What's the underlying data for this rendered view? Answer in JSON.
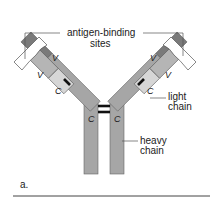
{
  "figure": {
    "panel_label": "a.",
    "labels": {
      "antigen_binding_line1": "antigen-binding",
      "antigen_binding_line2": "sites",
      "light_chain_line1": "light",
      "light_chain_line2": "chain",
      "heavy_chain_line1": "heavy",
      "heavy_chain_line2": "chain"
    },
    "domains": {
      "heavy_variable": "V",
      "light_variable": "V",
      "light_constant": "C",
      "heavy_constant_left": "C",
      "heavy_constant_right": "C"
    },
    "colors": {
      "heavy_constant": "#a6a6a6",
      "heavy_variable": "#7a7a7a",
      "light_variable": "#b5b5b5",
      "light_constant": "#d6d6d6",
      "binding_site": "#ffffff",
      "outline": "#555555",
      "disulfide": "#111111"
    }
  }
}
